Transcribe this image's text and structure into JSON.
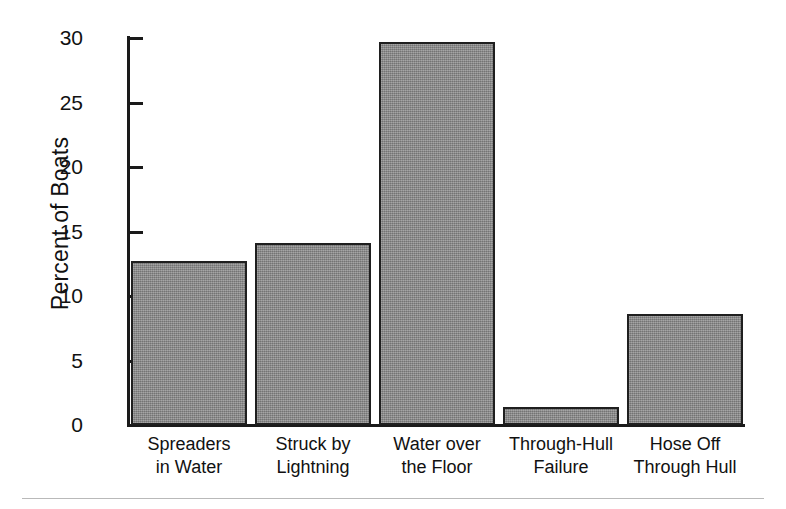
{
  "chart_data": {
    "type": "bar",
    "title": "",
    "xlabel": "",
    "ylabel": "Percent of Boats",
    "ylim": [
      0,
      30
    ],
    "yticks": [
      0,
      5,
      10,
      15,
      20,
      25,
      30
    ],
    "ytick_labels": [
      "0",
      "5",
      "10",
      "15",
      "20",
      "25",
      "30"
    ],
    "grid": false,
    "legend": "none",
    "bar_color": "#8c8c8c",
    "bar_edge_color": "#1f1f1f",
    "categories": [
      "Spreaders in Water",
      "Struck by Lightning",
      "Water over the Floor",
      "Through-Hull Failure",
      "Hose Off Through Hull"
    ],
    "category_lines": [
      [
        "Spreaders",
        "in Water"
      ],
      [
        "Struck by",
        "Lightning"
      ],
      [
        "Water over",
        "the Floor"
      ],
      [
        "Through-Hull",
        "Failure"
      ],
      [
        "Hose Off",
        "Through Hull"
      ]
    ],
    "values": [
      12.7,
      14.1,
      29.7,
      1.4,
      8.6
    ]
  }
}
